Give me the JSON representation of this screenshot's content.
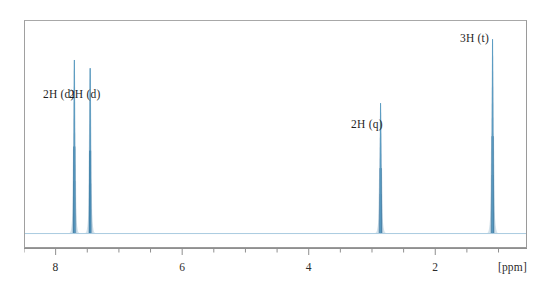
{
  "figure": {
    "type": "nmr-spectrum",
    "unit_label": "[ppm]",
    "frame_color": "#9a9a9a",
    "trace_color": "#3d7ca6",
    "baseline_color": "#9cc3da",
    "background": "#ffffff"
  },
  "axis": {
    "label": "[ppm]",
    "direction": "reversed",
    "min": 0.55,
    "max": 8.5,
    "major_ticks": [
      8,
      6,
      4,
      2
    ],
    "major_tick_labels": [
      "8",
      "6",
      "4",
      "2"
    ],
    "minor_tick_step": 0.5,
    "all_ticks": [
      8.5,
      8.0,
      7.5,
      7.0,
      6.5,
      6.0,
      5.5,
      5.0,
      4.5,
      4.0,
      3.5,
      3.0,
      2.5,
      2.0,
      1.5,
      1.0
    ]
  },
  "annotations": [
    {
      "name": "aromatic-doublet-downfield",
      "text": "2H (d)",
      "ppm": 7.72,
      "label_ppm": 7.95,
      "label_y": 88
    },
    {
      "name": "aromatic-doublet-upfield",
      "text": "2H (d)",
      "ppm": 7.47,
      "label_ppm": 7.54,
      "label_y": 88
    },
    {
      "name": "methylene-quartet",
      "text": "2H (q)",
      "ppm": 2.88,
      "label_ppm": 3.08,
      "label_y": 118
    },
    {
      "name": "methyl-triplet",
      "text": "3H (t)",
      "ppm": 1.11,
      "label_ppm": 1.38,
      "label_y": 32
    }
  ],
  "chart_data": {
    "type": "line",
    "title": "",
    "xlabel": "[ppm]",
    "ylabel": "",
    "xlim": [
      8.5,
      0.55
    ],
    "ylim": [
      0,
      1
    ],
    "grid": false,
    "legend": "none",
    "x_tick_labels": [
      "8",
      "6",
      "4",
      "2"
    ],
    "x_tick_values": [
      8,
      6,
      4,
      2
    ],
    "series": [
      {
        "name": "1H NMR trace",
        "color": "#3d7ca6",
        "baseline_intensity": 0.02,
        "peaks": [
          {
            "label": "2H (d)",
            "ppm": 7.72,
            "intensity": 0.84,
            "multiplicity": "d",
            "protons": 2,
            "width_ppm": 0.022
          },
          {
            "label": "2H (d)",
            "ppm": 7.47,
            "intensity": 0.8,
            "multiplicity": "d",
            "protons": 2,
            "width_ppm": 0.022
          },
          {
            "label": "2H (q)",
            "ppm": 2.88,
            "intensity": 0.63,
            "multiplicity": "q",
            "protons": 2,
            "width_ppm": 0.024
          },
          {
            "label": "3H (t)",
            "ppm": 1.11,
            "intensity": 0.94,
            "multiplicity": "t",
            "protons": 3,
            "width_ppm": 0.024
          }
        ]
      }
    ]
  }
}
